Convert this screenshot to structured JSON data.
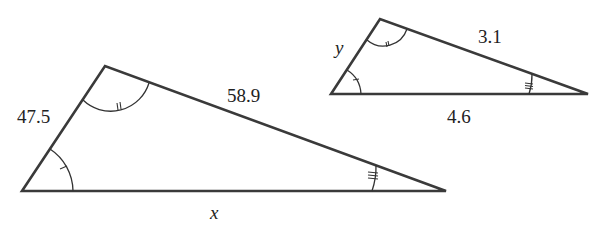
{
  "figure": {
    "large_triangle": {
      "vertices": {
        "bottom_left": [
          22,
          191
        ],
        "top": [
          105,
          66
        ],
        "right": [
          446,
          191
        ]
      },
      "labels": {
        "left_side": "47.5",
        "top_side": "58.9",
        "bottom_side": "x"
      },
      "angle_marks": {
        "bottom_left": "single tick",
        "top": "double tick",
        "right": "triple tick"
      }
    },
    "small_triangle": {
      "vertices": {
        "bottom_left": [
          331,
          94
        ],
        "top": [
          380,
          19
        ],
        "right": [
          588,
          94
        ]
      },
      "labels": {
        "left_side": "y",
        "top_side": "3.1",
        "bottom_side": "4.6"
      },
      "angle_marks": {
        "bottom_left": "single tick",
        "top": "double tick",
        "right": "triple tick"
      }
    },
    "colors": {
      "stroke": "#3a3a3a",
      "text": "#222222",
      "background": "#ffffff"
    }
  }
}
